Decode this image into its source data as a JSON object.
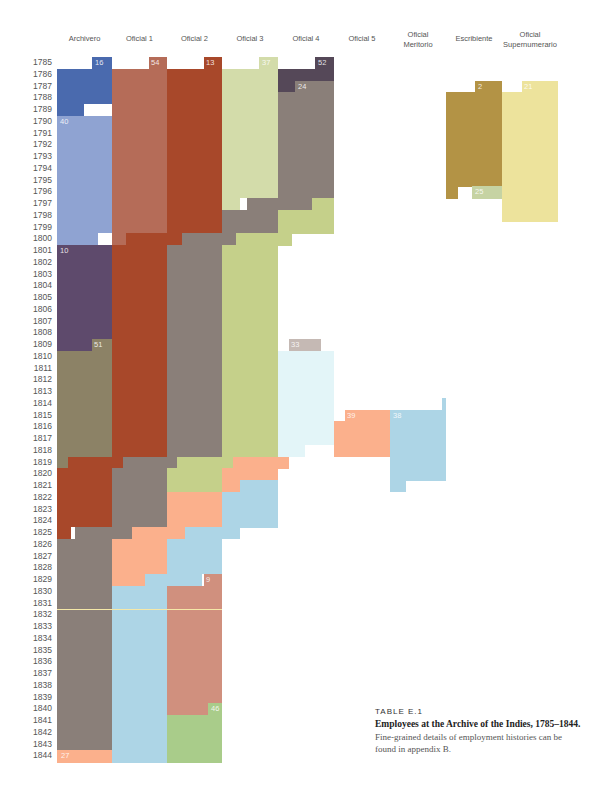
{
  "chart_data": {
    "type": "table",
    "title": "Employees at the Archive of the Indies, 1785–1844.",
    "label": "TABLE E.1",
    "description": "Fine-grained details of employment histories can be found in appendix B.",
    "grid": {
      "top": 57,
      "row_height": 11.75,
      "year_start": 1785,
      "year_end": 1844
    },
    "columns": [
      {
        "name": "Archivero",
        "x": 57,
        "w": 55
      },
      {
        "name": "Oficial 1",
        "x": 112,
        "w": 55
      },
      {
        "name": "Oficial 2",
        "x": 167,
        "w": 55
      },
      {
        "name": "Oficial 3",
        "x": 222,
        "w": 56
      },
      {
        "name": "Oficial 4",
        "x": 278,
        "w": 56
      },
      {
        "name": "Oficial 5",
        "x": 334,
        "w": 56
      },
      {
        "name": "Oficial Meritorio",
        "x": 390,
        "w": 56
      },
      {
        "name": "Escribiente",
        "x": 446,
        "w": 56
      },
      {
        "name": "Oficial Supernumerario",
        "x": 502,
        "w": 56
      }
    ],
    "years": [
      "1785",
      "1786",
      "1787",
      "1788",
      "1789",
      "1790",
      "1791",
      "1792",
      "1793",
      "1794",
      "1795",
      "1796",
      "1797",
      "1798",
      "1799",
      "1800",
      "1801",
      "1802",
      "1803",
      "1804",
      "1805",
      "1806",
      "1807",
      "1808",
      "1809",
      "1810",
      "1811",
      "1812",
      "1813",
      "1814",
      "1815",
      "1816",
      "1817",
      "1818",
      "1819",
      "1820",
      "1821",
      "1822",
      "1823",
      "1824",
      "1825",
      "1826",
      "1827",
      "1828",
      "1829",
      "1830",
      "1831",
      "1832",
      "1833",
      "1834",
      "1835",
      "1836",
      "1837",
      "1838",
      "1839",
      "1840",
      "1841",
      "1842",
      "1843",
      "1844"
    ],
    "blocks": [
      {
        "c": "#4a6aae",
        "x": 92,
        "w": 20,
        "r0": 0,
        "r1": 1
      },
      {
        "c": "#4a6aae",
        "x": 57,
        "w": 55,
        "r0": 1,
        "r1": 4
      },
      {
        "c": "#4a6aae",
        "x": 57,
        "w": 27,
        "r0": 4,
        "r1": 5
      },
      {
        "c": "#8fa3d2",
        "x": 57,
        "w": 55,
        "r0": 5,
        "r1": 15
      },
      {
        "c": "#8fa3d2",
        "x": 57,
        "w": 41,
        "r0": 15,
        "r1": 16
      },
      {
        "c": "#5e4a6c",
        "x": 57,
        "w": 55,
        "r0": 16,
        "r1": 24
      },
      {
        "c": "#5e4a6c",
        "x": 57,
        "w": 35,
        "r0": 24,
        "r1": 25
      },
      {
        "c": "#8c8266",
        "x": 92,
        "w": 20,
        "r0": 24,
        "r1": 25
      },
      {
        "c": "#8c8266",
        "x": 57,
        "w": 55,
        "r0": 25,
        "r1": 34
      },
      {
        "c": "#8c8266",
        "x": 57,
        "w": 11,
        "r0": 34,
        "r1": 35
      },
      {
        "c": "#a8482a",
        "x": 68,
        "w": 44,
        "r0": 34,
        "r1": 35
      },
      {
        "c": "#a8482a",
        "x": 57,
        "w": 55,
        "r0": 35,
        "r1": 40
      },
      {
        "c": "#a8482a",
        "x": 57,
        "w": 14,
        "r0": 40,
        "r1": 41
      },
      {
        "c": "#8a7f79",
        "x": 75,
        "w": 37,
        "r0": 40,
        "r1": 41
      },
      {
        "c": "#8a7f79",
        "x": 57,
        "w": 55,
        "r0": 41,
        "r1": 59
      },
      {
        "c": "#fbb08c",
        "x": 57,
        "w": 55,
        "r0": 59,
        "r1": 60
      },
      {
        "c": "#b56c58",
        "x": 149,
        "w": 18,
        "r0": 0,
        "r1": 1
      },
      {
        "c": "#b56c58",
        "x": 112,
        "w": 55,
        "r0": 1,
        "r1": 15
      },
      {
        "c": "#b56c58",
        "x": 112,
        "w": 14,
        "r0": 15,
        "r1": 16
      },
      {
        "c": "#a8482a",
        "x": 126,
        "w": 41,
        "r0": 15,
        "r1": 16
      },
      {
        "c": "#a8482a",
        "x": 112,
        "w": 55,
        "r0": 16,
        "r1": 34
      },
      {
        "c": "#a8482a",
        "x": 112,
        "w": 11,
        "r0": 34,
        "r1": 35
      },
      {
        "c": "#8a7f79",
        "x": 123,
        "w": 44,
        "r0": 34,
        "r1": 35
      },
      {
        "c": "#8a7f79",
        "x": 112,
        "w": 55,
        "r0": 35,
        "r1": 40
      },
      {
        "c": "#8a7f79",
        "x": 112,
        "w": 20,
        "r0": 40,
        "r1": 41
      },
      {
        "c": "#fbb08c",
        "x": 132,
        "w": 35,
        "r0": 40,
        "r1": 41
      },
      {
        "c": "#fbb08c",
        "x": 112,
        "w": 55,
        "r0": 41,
        "r1": 44
      },
      {
        "c": "#fbb08c",
        "x": 112,
        "w": 33,
        "r0": 44,
        "r1": 45
      },
      {
        "c": "#add5e6",
        "x": 145,
        "w": 22,
        "r0": 44,
        "r1": 45
      },
      {
        "c": "#add5e6",
        "x": 112,
        "w": 55,
        "r0": 45,
        "r1": 60
      },
      {
        "c": "#a8482a",
        "x": 204,
        "w": 18,
        "r0": 0,
        "r1": 1
      },
      {
        "c": "#a8482a",
        "x": 167,
        "w": 55,
        "r0": 1,
        "r1": 15
      },
      {
        "c": "#a8482a",
        "x": 167,
        "w": 15,
        "r0": 15,
        "r1": 16
      },
      {
        "c": "#8a7f79",
        "x": 182,
        "w": 40,
        "r0": 15,
        "r1": 16
      },
      {
        "c": "#8a7f79",
        "x": 167,
        "w": 55,
        "r0": 16,
        "r1": 34
      },
      {
        "c": "#8a7f79",
        "x": 167,
        "w": 10,
        "r0": 34,
        "r1": 35
      },
      {
        "c": "#c5d08a",
        "x": 177,
        "w": 45,
        "r0": 34,
        "r1": 35
      },
      {
        "c": "#c5d08a",
        "x": 167,
        "w": 55,
        "r0": 35,
        "r1": 37
      },
      {
        "c": "#fbb08c",
        "x": 167,
        "w": 55,
        "r0": 37,
        "r1": 40
      },
      {
        "c": "#fbb08c",
        "x": 167,
        "w": 18,
        "r0": 40,
        "r1": 41
      },
      {
        "c": "#add5e6",
        "x": 185,
        "w": 37,
        "r0": 40,
        "r1": 41
      },
      {
        "c": "#add5e6",
        "x": 167,
        "w": 55,
        "r0": 41,
        "r1": 44
      },
      {
        "c": "#add5e6",
        "x": 167,
        "w": 35,
        "r0": 44,
        "r1": 45
      },
      {
        "c": "#d0907e",
        "x": 203,
        "w": 19,
        "r0": 44,
        "r1": 45
      },
      {
        "c": "#d0907e",
        "x": 167,
        "w": 55,
        "r0": 45,
        "r1": 56
      },
      {
        "c": "#d0907e",
        "x": 167,
        "w": 41,
        "r0": 55,
        "r1": 56
      },
      {
        "c": "#a9cc8a",
        "x": 208,
        "w": 14,
        "r0": 55,
        "r1": 56
      },
      {
        "c": "#a9cc8a",
        "x": 167,
        "w": 55,
        "r0": 56,
        "r1": 60
      },
      {
        "c": "#d3dcaa",
        "x": 259,
        "w": 19,
        "r0": 0,
        "r1": 1
      },
      {
        "c": "#d3dcaa",
        "x": 222,
        "w": 56,
        "r0": 1,
        "r1": 12
      },
      {
        "c": "#d3dcaa",
        "x": 222,
        "w": 18,
        "r0": 12,
        "r1": 13
      },
      {
        "c": "#d3dcaa",
        "x": 247,
        "w": 31,
        "r0": 12,
        "r1": 13
      },
      {
        "c": "#8a7f79",
        "x": 247,
        "w": 31,
        "r0": 12,
        "r1": 13
      },
      {
        "c": "#8a7f79",
        "x": 222,
        "w": 56,
        "r0": 13,
        "r1": 15
      },
      {
        "c": "#8a7f79",
        "x": 222,
        "w": 14,
        "r0": 15,
        "r1": 16
      },
      {
        "c": "#c5d08a",
        "x": 236,
        "w": 42,
        "r0": 15,
        "r1": 16
      },
      {
        "c": "#c5d08a",
        "x": 222,
        "w": 56,
        "r0": 16,
        "r1": 34
      },
      {
        "c": "#c5d08a",
        "x": 222,
        "w": 11,
        "r0": 34,
        "r1": 35
      },
      {
        "c": "#fbb08c",
        "x": 233,
        "w": 56,
        "r0": 34,
        "r1": 35
      },
      {
        "c": "#fbb08c",
        "x": 222,
        "w": 56,
        "r0": 35,
        "r1": 36
      },
      {
        "c": "#fbb08c",
        "x": 222,
        "w": 18,
        "r0": 36,
        "r1": 37
      },
      {
        "c": "#add5e6",
        "x": 240,
        "w": 38,
        "r0": 36,
        "r1": 37
      },
      {
        "c": "#add5e6",
        "x": 222,
        "w": 56,
        "r0": 37,
        "r1": 40
      },
      {
        "c": "#add5e6",
        "x": 222,
        "w": 18,
        "r0": 40,
        "r1": 41
      },
      {
        "c": "#554858",
        "x": 315,
        "w": 19,
        "r0": 0,
        "r1": 1
      },
      {
        "c": "#554858",
        "x": 278,
        "w": 56,
        "r0": 1,
        "r1": 2
      },
      {
        "c": "#554858",
        "x": 278,
        "w": 17,
        "r0": 2,
        "r1": 3
      },
      {
        "c": "#8a7f79",
        "x": 295,
        "w": 39,
        "r0": 2,
        "r1": 3
      },
      {
        "c": "#8a7f79",
        "x": 278,
        "w": 56,
        "r0": 3,
        "r1": 12
      },
      {
        "c": "#8a7f79",
        "x": 278,
        "w": 34,
        "r0": 12,
        "r1": 13
      },
      {
        "c": "#c5d08a",
        "x": 312,
        "w": 22,
        "r0": 12,
        "r1": 13
      },
      {
        "c": "#c5d08a",
        "x": 278,
        "w": 56,
        "r0": 13,
        "r1": 15
      },
      {
        "c": "#c5d08a",
        "x": 278,
        "w": 14,
        "r0": 15,
        "r1": 16
      },
      {
        "c": "#c5b9b4",
        "x": 289,
        "w": 32,
        "r0": 24,
        "r1": 25
      },
      {
        "c": "#e3f5f8",
        "x": 278,
        "w": 56,
        "r0": 25,
        "r1": 33
      },
      {
        "c": "#e3f5f8",
        "x": 278,
        "w": 27,
        "r0": 33,
        "r1": 34
      },
      {
        "c": "#fbb08c",
        "x": 345,
        "w": 45,
        "r0": 30,
        "r1": 31
      },
      {
        "c": "#fbb08c",
        "x": 334,
        "w": 56,
        "r0": 31,
        "r1": 34
      },
      {
        "c": "#add5e6",
        "x": 390,
        "w": 56,
        "r0": 30,
        "r1": 36
      },
      {
        "c": "#add5e6",
        "x": 390,
        "w": 16,
        "r0": 36,
        "r1": 37
      },
      {
        "c": "#add5e6",
        "x": 442,
        "w": 4,
        "r0": 29,
        "r1": 30
      },
      {
        "c": "#b39345",
        "x": 475,
        "w": 27,
        "r0": 2,
        "r1": 3
      },
      {
        "c": "#b39345",
        "x": 446,
        "w": 56,
        "r0": 3,
        "r1": 11
      },
      {
        "c": "#b39345",
        "x": 446,
        "w": 12,
        "r0": 11,
        "r1": 12
      },
      {
        "c": "#c6d3a3",
        "x": 472,
        "w": 30,
        "r0": 11,
        "r1": 12
      },
      {
        "c": "#ede39c",
        "x": 522,
        "w": 36,
        "r0": 2,
        "r1": 3
      },
      {
        "c": "#ede39c",
        "x": 502,
        "w": 56,
        "r0": 3,
        "r1": 14
      }
    ],
    "annotations": [
      {
        "text": "16",
        "x": 95,
        "r": 0
      },
      {
        "text": "54",
        "x": 151,
        "r": 0
      },
      {
        "text": "13",
        "x": 206,
        "r": 0
      },
      {
        "text": "37",
        "x": 262,
        "r": 0
      },
      {
        "text": "52",
        "x": 318,
        "r": 0
      },
      {
        "text": "24",
        "x": 298,
        "r": 2
      },
      {
        "text": "40",
        "x": 60,
        "r": 5
      },
      {
        "text": "10",
        "x": 60,
        "r": 16
      },
      {
        "text": "51",
        "x": 94,
        "r": 24
      },
      {
        "text": "33",
        "x": 291,
        "r": 24
      },
      {
        "text": "39",
        "x": 347,
        "r": 30
      },
      {
        "text": "38",
        "x": 393,
        "r": 30
      },
      {
        "text": "9",
        "x": 206,
        "r": 44
      },
      {
        "text": "46",
        "x": 211,
        "r": 55
      },
      {
        "text": "27",
        "x": 61,
        "r": 59
      },
      {
        "text": "2",
        "x": 478,
        "r": 2
      },
      {
        "text": "21",
        "x": 524,
        "r": 2
      },
      {
        "text": "25",
        "x": 475,
        "r": 11
      }
    ],
    "gaps_white": [
      {
        "x": 84,
        "w": 28,
        "r0": 4,
        "r1": 5
      },
      {
        "x": 98,
        "w": 14,
        "r0": 15,
        "r1": 16
      },
      {
        "x": 71,
        "w": 4,
        "r0": 40,
        "r1": 41
      },
      {
        "x": 240,
        "w": 7,
        "r0": 12,
        "r1": 13
      },
      {
        "x": 202,
        "w": 2,
        "r0": 44,
        "r1": 45
      }
    ],
    "highlight_line_row": 47
  }
}
